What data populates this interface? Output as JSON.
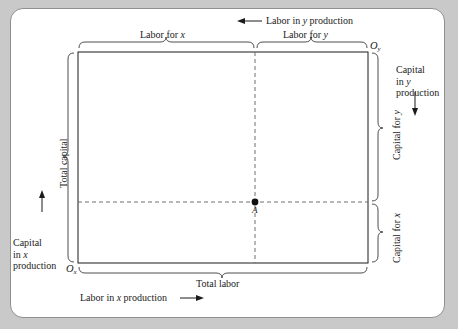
{
  "figure": {
    "type": "edgeworth-box",
    "background_color": "#c9c9c9",
    "card_color": "#ffffff",
    "line_color": "#1b1b1b",
    "dash_color": "#6e6e6e"
  },
  "labels": {
    "labor_for_x": "Labor for x",
    "labor_for_y": "Labor for y",
    "labor_in_y_production": "Labor in y production",
    "labor_in_x_production": "Labor in x production",
    "capital_for_y": "Capital for y",
    "capital_for_x": "Capital for x",
    "capital_in_y_production": "Capital\nin y\nproduction",
    "capital_in_x_production": "Capital\nin x\nproduction",
    "total_capital": "Total capital",
    "total_labor": "Total labor",
    "origin_x": "O",
    "origin_x_sub": "x",
    "origin_y": "O",
    "origin_y_sub": "y",
    "point_a": "A"
  },
  "icons": {
    "arrow_left": "arrow-left-icon",
    "arrow_right": "arrow-right-icon",
    "arrow_up": "arrow-up-icon",
    "arrow_down": "arrow-down-icon"
  },
  "chart_data": {
    "type": "diagram",
    "box": {
      "left": 78,
      "top": 52,
      "right": 368,
      "bottom": 263
    },
    "allocation_point": {
      "name": "A",
      "x": 255,
      "y": 202
    },
    "divisions": {
      "labor_split_x": 255,
      "capital_split_y": 202
    },
    "axes": {
      "origin_x_corner": "bottom-left",
      "origin_y_corner": "top-right",
      "horizontal_total": "Total labor",
      "vertical_total": "Total capital"
    }
  }
}
